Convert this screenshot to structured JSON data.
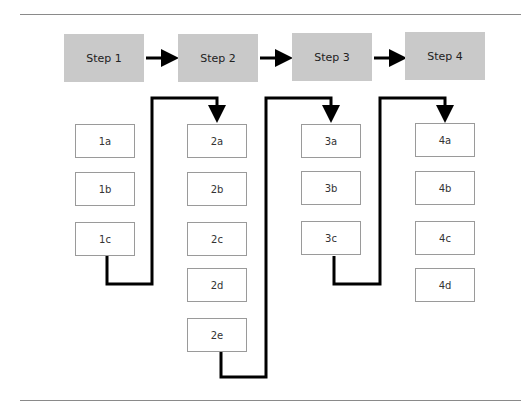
{
  "steps": [
    {
      "label": "Step 1",
      "items": [
        "1a",
        "1b",
        "1c"
      ]
    },
    {
      "label": "Step 2",
      "items": [
        "2a",
        "2b",
        "2c",
        "2d",
        "2e"
      ]
    },
    {
      "label": "Step 3",
      "items": [
        "3a",
        "3b",
        "3c"
      ]
    },
    {
      "label": "Step 4",
      "items": [
        "4a",
        "4b",
        "4c",
        "4d"
      ]
    }
  ]
}
